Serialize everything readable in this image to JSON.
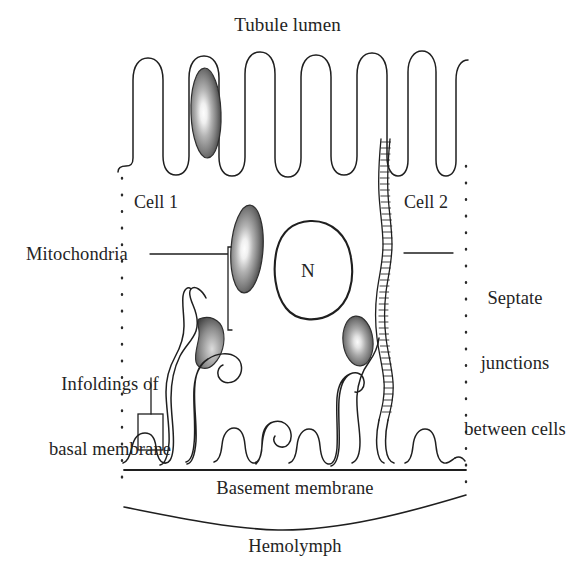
{
  "figure": {
    "kind": "biological-diagram",
    "background_color": "#ffffff",
    "ink_color": "#1a1a1a"
  },
  "labels": {
    "tubule_lumen": "Tubule lumen",
    "cell_1": "Cell 1",
    "cell_2": "Cell 2",
    "mitochondria": "Mitochondria",
    "septate_line_1": "Septate",
    "septate_line_2": "junctions",
    "septate_line_3": "between cells",
    "infoldings_line_1": "Infoldings of",
    "infoldings_line_2": "basal membrane",
    "basement_membrane": "Basement membrane",
    "hemolymph": "Hemolymph",
    "nucleus_symbol": "N"
  },
  "structures": {
    "microvilli_count": 11,
    "mitochondria_count": 4,
    "nucleus_count": 1,
    "septate_junction_rungs": 46,
    "basal_infolding_count": 9,
    "cell_boundary_style": "dotted",
    "membrane_stroke_width": 1.4
  },
  "colors": {
    "mitochondria_edge": "#3a3a3a",
    "mitochondria_mid": "#8e8e8e",
    "mitochondria_core": "#fbfbfb",
    "membrane": "#1f1f1f",
    "dotted_boundary": "#2b2b2b",
    "text": "#242424"
  }
}
